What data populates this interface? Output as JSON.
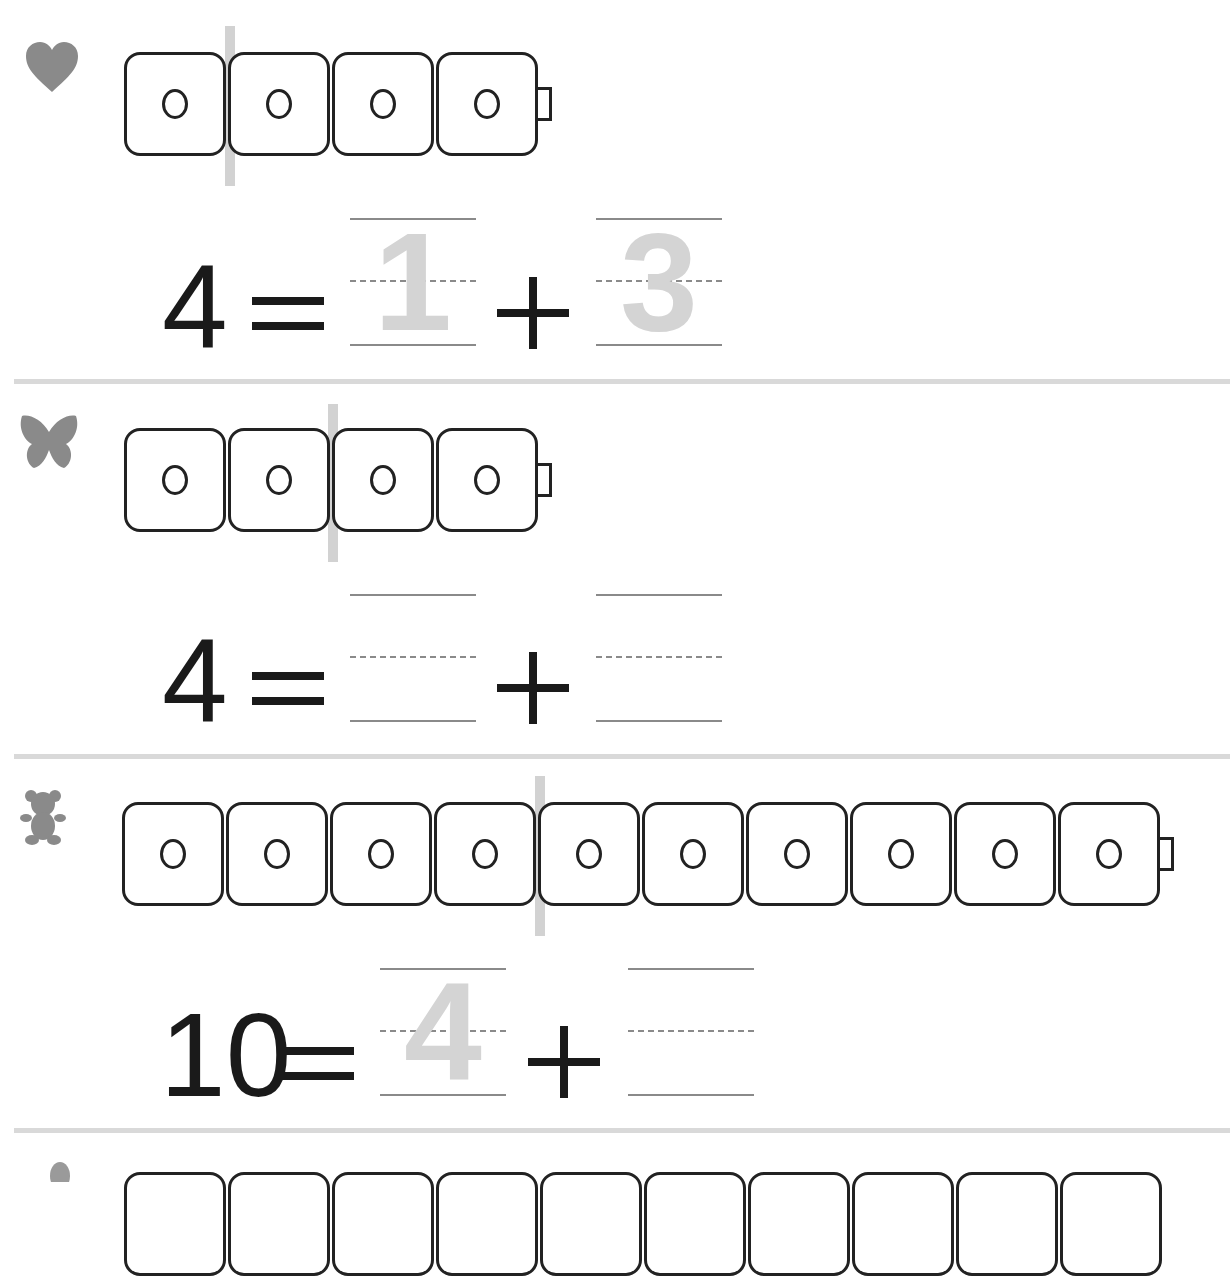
{
  "worksheet": {
    "problems": [
      {
        "icon": "heart-icon",
        "cubes": 4,
        "split_after": 1,
        "total": "4",
        "equals": "=",
        "plus": "+",
        "answer_a_trace": "1",
        "answer_b_trace": "3"
      },
      {
        "icon": "butterfly-icon",
        "cubes": 4,
        "split_after": 2,
        "total": "4",
        "equals": "=",
        "plus": "+",
        "answer_a_trace": "",
        "answer_b_trace": ""
      },
      {
        "icon": "teddy-bear-icon",
        "cubes": 10,
        "split_after": 4,
        "total": "10",
        "equals": "=",
        "plus": "+",
        "answer_a_trace": "4",
        "answer_b_trace": ""
      },
      {
        "icon": "pear-icon",
        "cubes": 10,
        "partial": true
      }
    ],
    "colors": {
      "ink": "#1a1a1a",
      "trace": "#d4d4d4",
      "guide_line": "#8a8a8a",
      "divider": "#d9d9d9",
      "icon": "#8a8a8a"
    }
  }
}
